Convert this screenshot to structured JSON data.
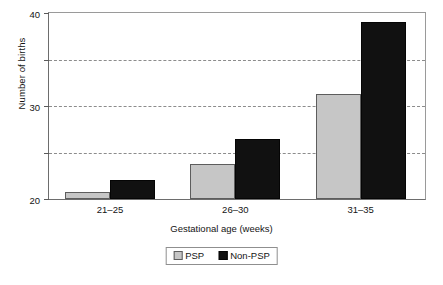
{
  "chart_data": {
    "type": "bar",
    "title": "",
    "xlabel": "Gestational age (weeks)",
    "ylabel": "Number of births",
    "categories": [
      "21–25",
      "26–30",
      "31–35"
    ],
    "series": [
      {
        "name": "PSP",
        "values": [
          1.5,
          7.5,
          22.5
        ],
        "color": "#c6c6c6"
      },
      {
        "name": "Non-PSP",
        "values": [
          4,
          13,
          38
        ],
        "color": "#111111"
      }
    ],
    "ylim": [
      0,
      40
    ],
    "yticks": [
      0,
      10,
      20,
      30,
      40
    ],
    "ytick_labels": [
      "0",
      "10",
      "20",
      "30",
      "40"
    ],
    "gridlines": [
      10,
      20,
      30
    ],
    "grid": true,
    "legend_position": "bottom-center"
  },
  "axes": {
    "y_title": "Number of births",
    "x_title": "Gestational age (weeks)"
  },
  "legend": {
    "items": [
      {
        "label": "PSP",
        "swatch": "light-gray-swatch"
      },
      {
        "label": "Non-PSP",
        "swatch": "black-swatch"
      }
    ]
  },
  "colors": {
    "psp": "#c6c6c6",
    "non_psp": "#111111",
    "grid": "#8c8c8c",
    "axis": "#6d6d6d",
    "background": "#ffffff"
  }
}
